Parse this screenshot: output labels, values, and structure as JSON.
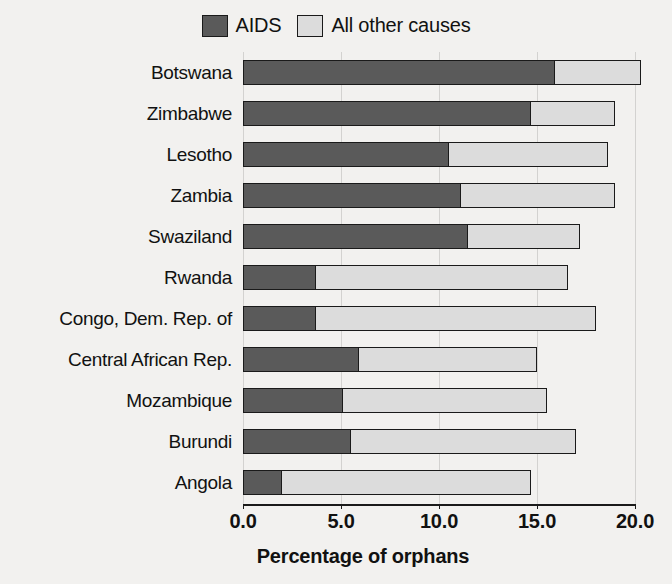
{
  "legend": {
    "position": "top-center",
    "entries": [
      {
        "label": "AIDS",
        "color": "#5a5a5a",
        "swatch": "legend-swatch-aids"
      },
      {
        "label": "All other causes",
        "color": "#dcdcdc",
        "swatch": "legend-swatch-other"
      }
    ]
  },
  "axis": {
    "x_title": "Percentage of orphans",
    "tick_labels": [
      "0.0",
      "5.0",
      "10.0",
      "15.0",
      "20.0"
    ],
    "tick_values": [
      0,
      5,
      10,
      15,
      20
    ],
    "xmin": 0,
    "xmax": 21.3
  },
  "chart_data": {
    "type": "bar",
    "orientation": "horizontal",
    "stacked": true,
    "title": "",
    "subtitle": "",
    "xlabel": "Percentage of orphans",
    "ylabel": "",
    "xlim": [
      0,
      21.3
    ],
    "xticks": [
      0,
      5,
      10,
      15,
      20
    ],
    "grid": true,
    "grid_axis": "x",
    "legend_position": "top-center",
    "categories": [
      "Botswana",
      "Zimbabwe",
      "Lesotho",
      "Zambia",
      "Swaziland",
      "Rwanda",
      "Congo, Dem. Rep. of",
      "Central African Rep.",
      "Mozambique",
      "Burundi",
      "Angola"
    ],
    "series": [
      {
        "name": "AIDS",
        "color": "#5a5a5a",
        "values": [
          15.9,
          14.7,
          10.5,
          11.1,
          11.5,
          3.7,
          3.7,
          5.9,
          5.1,
          5.5,
          2.0
        ]
      },
      {
        "name": "All other causes",
        "color": "#dcdcdc",
        "values": [
          4.4,
          4.3,
          8.1,
          7.9,
          5.7,
          12.9,
          14.3,
          9.1,
          10.4,
          11.5,
          12.7
        ]
      }
    ],
    "totals": [
      20.3,
      19.0,
      18.6,
      19.0,
      17.2,
      16.6,
      18.0,
      15.0,
      15.5,
      17.0,
      14.7
    ]
  }
}
